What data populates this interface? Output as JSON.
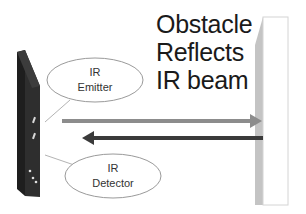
{
  "diagram": {
    "title_lines": [
      "Obstacle",
      "Reflects",
      "IR beam"
    ],
    "emitter_label": [
      "IR",
      "Emitter"
    ],
    "detector_label": [
      "IR",
      "Detector"
    ],
    "arrows": [
      {
        "name": "emitted-beam",
        "direction": "right",
        "color": "#8c8c8c"
      },
      {
        "name": "reflected-beam",
        "direction": "left",
        "color": "#3a3a3a"
      }
    ],
    "colors": {
      "device_front": "#2b2b2b",
      "device_side": "#4a4a4a",
      "wall_front": "#ffffff",
      "wall_bevel": "#c4c4c4",
      "ellipse_stroke": "#9a9a9a",
      "emitted_arrow": "#8c8c8c",
      "reflected_arrow": "#3a3a3a"
    }
  }
}
